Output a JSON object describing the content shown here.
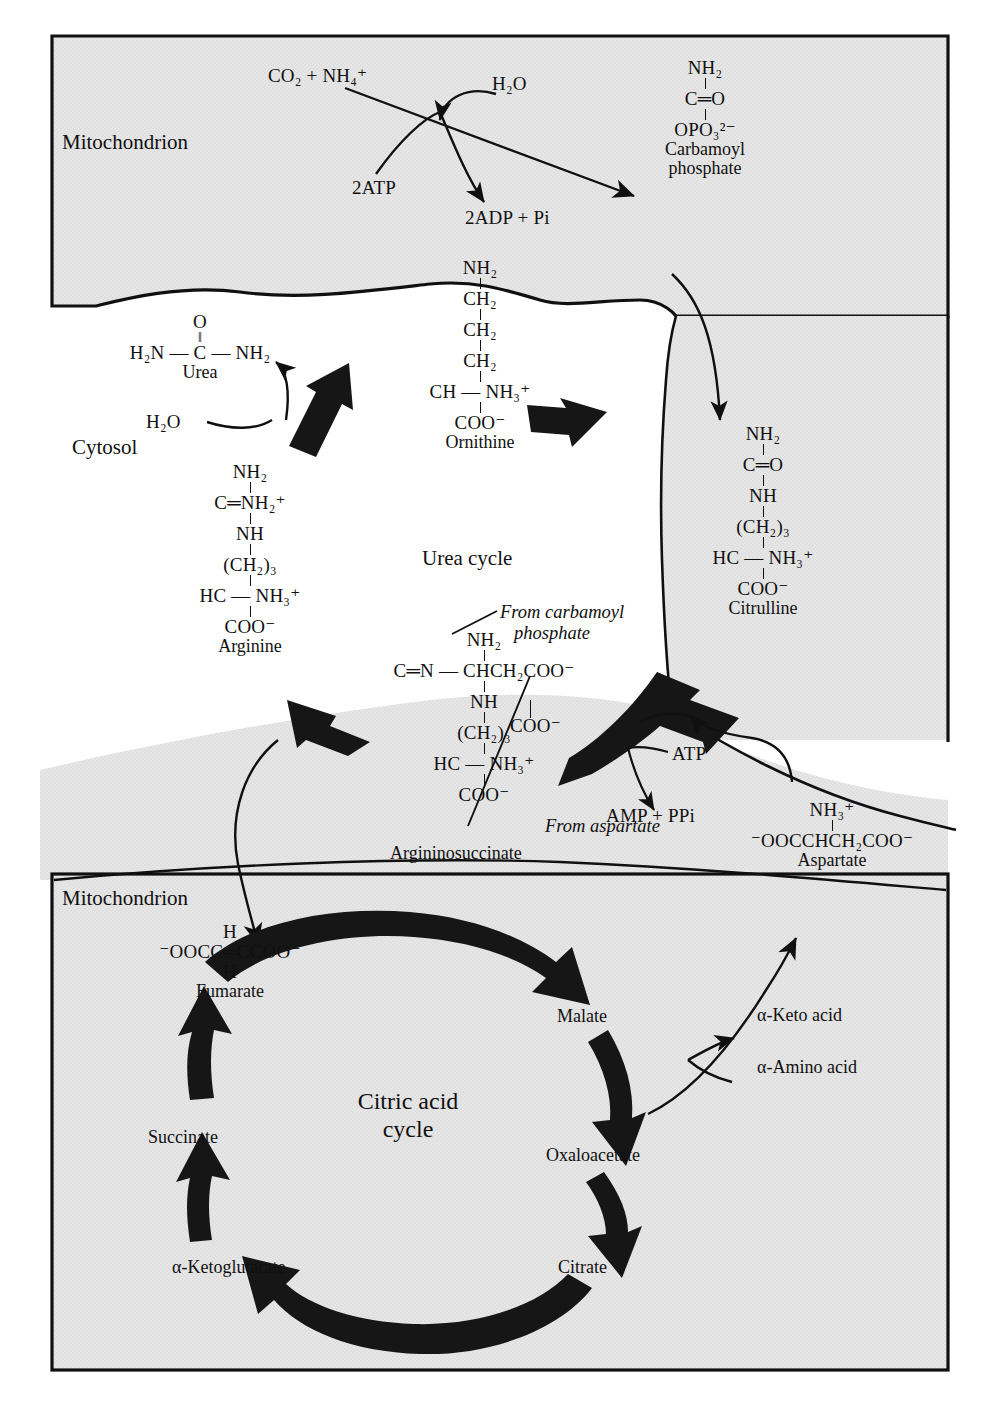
{
  "figure": {
    "compartments": {
      "mito_top": "Mitochondrion",
      "cytosol": "Cytosol",
      "mito_bottom": "Mitochondrion"
    },
    "cycle_labels": {
      "urea_cycle": "Urea cycle",
      "citric_acid_cycle_line1": "Citric acid",
      "citric_acid_cycle_line2": "cycle"
    }
  },
  "top_reaction": {
    "substrates": "CO₂ + NH₄⁺",
    "water": "H₂O",
    "atp": "2ATP",
    "adp": "2ADP + Pi"
  },
  "molecules": {
    "carbamoyl_phosphate": {
      "name_line1": "Carbamoyl",
      "name_line2": "phosphate",
      "l1": "NH₂",
      "l2": "C═O",
      "l3": "OPO₃²⁻"
    },
    "ornithine": {
      "name": "Ornithine",
      "l1": "NH₂",
      "l2": "CH₂",
      "l3": "CH₂",
      "l4": "CH₂",
      "l5": "CH — NH₃⁺",
      "l6": "COO⁻"
    },
    "urea": {
      "name": "Urea",
      "top": "O",
      "dbl": "‖",
      "body": "H₂N — C — NH₂",
      "water": "H₂O"
    },
    "citrulline": {
      "name": "Citrulline",
      "l1": "NH₂",
      "l2": "C═O",
      "l3": "NH",
      "l4": "(CH₂)₃",
      "l5": "HC — NH₃⁺",
      "l6": "COO⁻"
    },
    "arginine": {
      "name": "Arginine",
      "l1": "NH₂",
      "l2": "C═NH₂⁺",
      "l3": "NH",
      "l4": "(CH₂)₃",
      "l5": "HC — NH₃⁺",
      "l6": "COO⁻"
    },
    "argininosuccinate": {
      "name": "Argininosuccinate",
      "l1": "NH₂",
      "l2": "C═N — CHCH₂COO⁻",
      "l2b": "COO⁻",
      "l3": "NH",
      "l4": "(CH₂)₃",
      "l5": "HC — NH₃⁺",
      "l6": "COO⁻",
      "note_from_carbamoyl_line1": "From carbamoyl",
      "note_from_carbamoyl_line2": "phosphate",
      "note_from_aspartate": "From aspartate",
      "atp": "ATP",
      "amp": "AMP + PPi"
    },
    "aspartate": {
      "name": "Aspartate",
      "l1": "NH₃⁺",
      "l2": "⁻OOCCHCH₂COO⁻"
    },
    "fumarate": {
      "name": "Fumarate",
      "top_h": "H",
      "body": "⁻OOCC═CCOO⁻",
      "bottom_h": "H"
    }
  },
  "citric_acid_cycle": {
    "intermediates": [
      "Malate",
      "Oxaloacetate",
      "Citrate",
      "α-Ketoglutarate",
      "Succinate",
      "Fumarate"
    ],
    "transamination": {
      "keto_acid": "α-Keto acid",
      "amino_acid": "α-Amino acid"
    }
  },
  "colors": {
    "ink": "#101010",
    "shade": "#e2e2e2",
    "page": "#ffffff",
    "arrow_fill": "#1c1c1c"
  }
}
